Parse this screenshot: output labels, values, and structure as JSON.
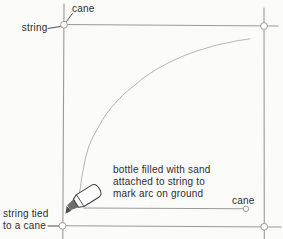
{
  "figure": {
    "colors": {
      "background": "#fbfbf9",
      "line": "#9a9a9a",
      "arc": "#b5b5b5",
      "leader": "#4d4d4d",
      "text": "#2d2d2d",
      "cane_fill": "#ffffff",
      "bottle_fill": "#ffffff",
      "bottle_neck": "#6e6e6e",
      "bottle_outline": "#3c3c3c"
    },
    "labels": {
      "cane_top": "cane",
      "string": "string",
      "string_tied": {
        "line1": "string tied",
        "line2": "to a cane"
      },
      "bottle_note": {
        "line1": "bottle filled with sand",
        "line2": "attached to string to",
        "line3": "mark arc on ground"
      },
      "cane_bottom": "cane"
    }
  }
}
